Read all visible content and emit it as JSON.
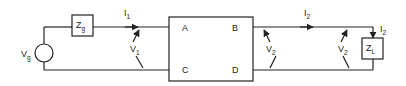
{
  "diagram": {
    "source": {
      "label": "V",
      "sub": "g"
    },
    "source_impedance": {
      "label": "Z",
      "sub": "g"
    },
    "load_impedance": {
      "label": "Z",
      "sub": "L"
    },
    "two_port": {
      "terminals": [
        "A",
        "B",
        "C",
        "D"
      ]
    },
    "currents": [
      {
        "label": "I",
        "sub": "1"
      },
      {
        "label": "I",
        "sub": "2"
      },
      {
        "label": "I",
        "sub": "2"
      }
    ],
    "voltages": [
      {
        "label": "V",
        "sub": "1"
      },
      {
        "label": "V",
        "sub": "2"
      },
      {
        "label": "V",
        "sub": "2"
      }
    ]
  }
}
